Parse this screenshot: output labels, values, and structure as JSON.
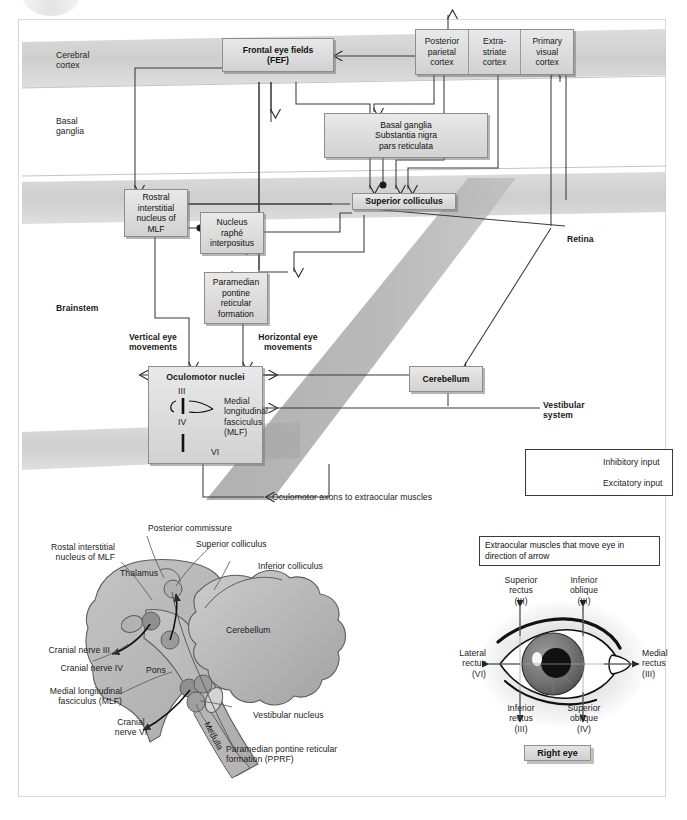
{
  "diagram": {
    "level_labels": [
      {
        "name": "cerebral-cortex",
        "text": "Cerebral\ncortex"
      },
      {
        "name": "basal-ganglia",
        "text": "Basal\nganglia"
      },
      {
        "name": "brainstem",
        "text": "Brainstem"
      }
    ],
    "boxes": {
      "fef": "Frontal eye fields\n(FEF)",
      "posterior_parietal": "Posterior\nparietal\ncortex",
      "extrastriate": "Extra-\nstriate\ncortex",
      "primary_visual": "Primary\nvisual\ncortex",
      "basal_ganglia": "Basal ganglia\nSubstantia nigra\npars reticulata",
      "rostral_mlf": "Rostral\ninterstitial\nnucleus of\nMLF",
      "nucleus_raphe": "Nucleus\nraphé\ninterpositus",
      "pprf": "Paramedian\npontine\nreticular\nformation",
      "superior_colliculus": "Superior colliculus",
      "oculomotor_nuclei": "Oculomotor nuclei",
      "cerebellum": "Cerebellum"
    },
    "free_labels": {
      "retina": "Retina",
      "vertical_eye": "Vertical eye\nmovements",
      "horizontal_eye": "Horizontal eye\nmovements",
      "vestibular_system": "Vestibular\nsystem",
      "oculomotor_axons": "Oculomotor axons to extraocular muscles"
    },
    "oculomotor_inner": {
      "nerve_3": "III",
      "nerve_4": "IV",
      "nerve_6": "VI",
      "mlf": "Medial\nlongitudinal\nfasciculus\n(MLF)"
    },
    "legend": {
      "inhibitory": "Inhibitory input",
      "excitatory": "Excitatory input"
    }
  },
  "brainstem_illustration": {
    "labels": {
      "posterior_commissure": "Posterior commissure",
      "superior_colliculus": "Superior colliculus",
      "inferior_colliculus": "Inferior colliculus",
      "rostral_mlf": "Rostal interstitial\nnucleus of MLF",
      "thalamus": "Thalamus",
      "cerebellum": "Cerebellum",
      "cranial_nerve_3": "Cranial nerve III",
      "cranial_nerve_4": "Cranial nerve IV",
      "mlf": "Medial longitudinal\nfasciculus (MLF)",
      "pons": "Pons",
      "cranial_nerve_6": "Cranial\nnerve VI",
      "medulla": "Medulla",
      "vestibular_nucleus": "Vestibular nucleus",
      "pprf": "Paramedian pontine reticular\nformation (PPRF)"
    }
  },
  "eye_panel": {
    "caption": "Extraocular muscles that move\neye in direction of arrow",
    "chip": "Right eye",
    "muscles": {
      "superior_rectus": "Superior\nrectus\n(III)",
      "inferior_oblique": "Inferior\noblique\n(III)",
      "lateral_rectus": "Lateral\nrectus\n(VI)",
      "medial_rectus": "Medial\nrectus\n(III)",
      "inferior_rectus": "Inferior\nrectus\n(III)",
      "superior_oblique": "Superior\noblique\n(IV)"
    }
  },
  "colors": {
    "box_fill": "#dedede",
    "box_border": "#8d8d8d",
    "band_gray": "#c9c9c9",
    "diagonal_band": "#9b9b9b",
    "line": "#3a3a3a",
    "anatomy_fill": "#b9b9b9"
  }
}
